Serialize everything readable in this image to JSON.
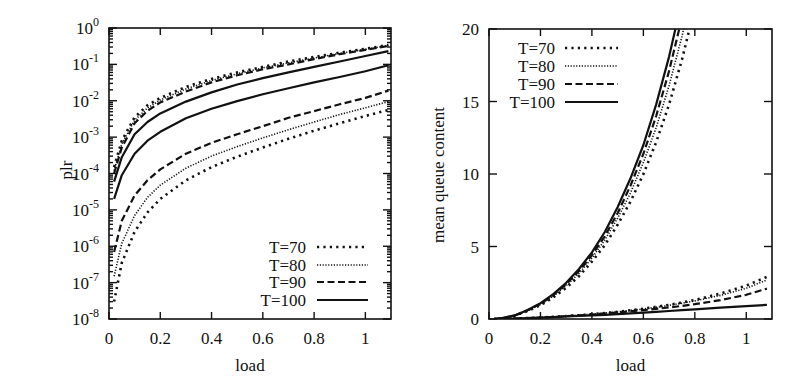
{
  "figure": {
    "panels": [
      "plr-vs-load",
      "mean-queue-content-vs-load"
    ]
  },
  "styles": {
    "T=70": {
      "dash": "2.2 4.2",
      "width": 2.6
    },
    "T=80": {
      "dash": "1.2 1.6",
      "width": 1.6
    },
    "T=90": {
      "dash": "7 3.5",
      "width": 2.2
    },
    "T=100": {
      "dash": "",
      "width": 2.2
    }
  },
  "chart_data": [
    {
      "type": "line",
      "title": "",
      "xlabel": "load",
      "ylabel": "plr",
      "xlim": [
        0,
        1.1
      ],
      "ylim": [
        1e-08,
        1
      ],
      "yscale": "log",
      "grid": false,
      "legend_position": "lower right",
      "x_ticks": [
        0,
        0.2,
        0.4,
        0.6,
        0.8,
        1
      ],
      "x_tick_labels": [
        "0",
        "0.2",
        "0.4",
        "0.6",
        "0.8",
        "1"
      ],
      "y_ticks_exponents": [
        0,
        -1,
        -2,
        -3,
        -4,
        -5,
        -6,
        -7,
        -8
      ],
      "y_tick_labels": [
        "10^0",
        "10^-1",
        "10^-2",
        "10^-3",
        "10^-4",
        "10^-5",
        "10^-6",
        "10^-7",
        "10^-8"
      ],
      "legend": [
        "T=70",
        "T=80",
        "T=90",
        "T=100"
      ],
      "x": [
        0.02,
        0.05,
        0.1,
        0.15,
        0.2,
        0.3,
        0.4,
        0.5,
        0.6,
        0.7,
        0.8,
        0.9,
        1.0,
        1.09
      ],
      "series": [
        {
          "name": "T=70",
          "group": "upper",
          "values": [
            0.00015,
            0.0008,
            0.0035,
            0.0075,
            0.012,
            0.024,
            0.04,
            0.06,
            0.085,
            0.12,
            0.16,
            0.21,
            0.27,
            0.34
          ]
        },
        {
          "name": "T=80",
          "group": "upper",
          "values": [
            0.00012,
            0.00065,
            0.0029,
            0.0063,
            0.0105,
            0.021,
            0.036,
            0.055,
            0.08,
            0.11,
            0.15,
            0.2,
            0.26,
            0.33
          ]
        },
        {
          "name": "T=90",
          "group": "upper",
          "values": [
            0.0001,
            0.00052,
            0.0024,
            0.0053,
            0.009,
            0.018,
            0.032,
            0.05,
            0.073,
            0.1,
            0.14,
            0.19,
            0.25,
            0.32
          ]
        },
        {
          "name": "T=100",
          "group": "upper",
          "values": [
            6e-05,
            0.00028,
            0.0012,
            0.0026,
            0.0045,
            0.0095,
            0.017,
            0.028,
            0.042,
            0.06,
            0.085,
            0.12,
            0.17,
            0.23
          ]
        },
        {
          "name": "T=100",
          "group": "lower",
          "values": [
            2e-05,
            9e-05,
            0.00035,
            0.0008,
            0.0014,
            0.0033,
            0.006,
            0.0098,
            0.015,
            0.022,
            0.032,
            0.045,
            0.065,
            0.095
          ]
        },
        {
          "name": "T=90",
          "group": "lower",
          "values": [
            7e-07,
            5e-06,
            2.5e-05,
            6.5e-05,
            0.00013,
            0.00035,
            0.0007,
            0.0012,
            0.002,
            0.0034,
            0.0052,
            0.008,
            0.012,
            0.019
          ]
        },
        {
          "name": "T=80",
          "group": "lower",
          "values": [
            1.5e-07,
            1.2e-06,
            7e-06,
            2.2e-05,
            4.8e-05,
            0.00014,
            0.0003,
            0.00055,
            0.00095,
            0.0016,
            0.0026,
            0.0042,
            0.0064,
            0.0095
          ]
        },
        {
          "name": "T=70",
          "group": "lower",
          "values": [
            3e-08,
            3.5e-07,
            2.5e-06,
            8.5e-06,
            2e-05,
            6.5e-05,
            0.00015,
            0.00029,
            0.00052,
            0.0009,
            0.0015,
            0.0024,
            0.0038,
            0.0056
          ]
        }
      ]
    },
    {
      "type": "line",
      "title": "",
      "xlabel": "load",
      "ylabel": "mean queue content",
      "xlim": [
        0,
        1.1
      ],
      "ylim": [
        0,
        20
      ],
      "yscale": "linear",
      "grid": false,
      "legend_position": "upper left",
      "x_ticks": [
        0,
        0.2,
        0.4,
        0.6,
        0.8,
        1
      ],
      "x_tick_labels": [
        "0",
        "0.2",
        "0.4",
        "0.6",
        "0.8",
        "1"
      ],
      "y_ticks": [
        0,
        5,
        10,
        15,
        20
      ],
      "y_tick_labels": [
        "0",
        "5",
        "10",
        "15",
        "20"
      ],
      "legend": [
        "T=70",
        "T=80",
        "T=90",
        "T=100"
      ],
      "x": [
        0.02,
        0.05,
        0.1,
        0.15,
        0.2,
        0.25,
        0.3,
        0.35,
        0.4,
        0.45,
        0.5,
        0.55,
        0.6,
        0.65,
        0.7,
        0.75,
        0.8,
        0.9,
        1.0,
        1.08
      ],
      "series": [
        {
          "name": "T=70",
          "group": "upper",
          "values": [
            0.0,
            0.05,
            0.22,
            0.55,
            0.95,
            1.5,
            2.15,
            2.95,
            3.95,
            5.1,
            6.5,
            8.1,
            10.0,
            12.2,
            14.8,
            17.9,
            21.5,
            null,
            null,
            null
          ]
        },
        {
          "name": "T=80",
          "group": "upper",
          "values": [
            0.0,
            0.05,
            0.23,
            0.57,
            1.0,
            1.58,
            2.3,
            3.15,
            4.2,
            5.45,
            6.95,
            8.7,
            10.8,
            13.2,
            16.1,
            19.5,
            23.5,
            null,
            null,
            null
          ]
        },
        {
          "name": "T=90",
          "group": "upper",
          "values": [
            0.0,
            0.05,
            0.24,
            0.6,
            1.05,
            1.65,
            2.4,
            3.3,
            4.4,
            5.7,
            7.3,
            9.2,
            11.4,
            14.0,
            17.1,
            20.8,
            null,
            null,
            null,
            null
          ]
        },
        {
          "name": "T=100",
          "group": "upper",
          "values": [
            0.0,
            0.06,
            0.25,
            0.62,
            1.1,
            1.72,
            2.5,
            3.45,
            4.6,
            6.0,
            7.7,
            9.7,
            12.0,
            14.8,
            18.1,
            22.0,
            null,
            null,
            null,
            null
          ]
        },
        {
          "name": "T=70",
          "group": "lower",
          "values": [
            0.0,
            0.01,
            0.03,
            0.06,
            0.1,
            0.15,
            0.2,
            0.26,
            0.33,
            0.41,
            0.5,
            0.6,
            0.71,
            0.84,
            0.98,
            1.14,
            1.32,
            1.75,
            2.3,
            2.9
          ]
        },
        {
          "name": "T=80",
          "group": "lower",
          "values": [
            0.0,
            0.01,
            0.03,
            0.06,
            0.1,
            0.15,
            0.2,
            0.26,
            0.33,
            0.41,
            0.49,
            0.59,
            0.69,
            0.81,
            0.94,
            1.09,
            1.25,
            1.63,
            2.12,
            2.7
          ]
        },
        {
          "name": "T=90",
          "group": "lower",
          "values": [
            0.0,
            0.01,
            0.03,
            0.06,
            0.1,
            0.14,
            0.19,
            0.25,
            0.31,
            0.38,
            0.45,
            0.53,
            0.61,
            0.7,
            0.8,
            0.9,
            1.02,
            1.3,
            1.67,
            2.1
          ]
        },
        {
          "name": "T=100",
          "group": "lower",
          "values": [
            0.0,
            0.01,
            0.03,
            0.06,
            0.09,
            0.13,
            0.17,
            0.21,
            0.25,
            0.29,
            0.34,
            0.39,
            0.44,
            0.49,
            0.55,
            0.61,
            0.67,
            0.78,
            0.89,
            0.97
          ]
        }
      ]
    }
  ]
}
